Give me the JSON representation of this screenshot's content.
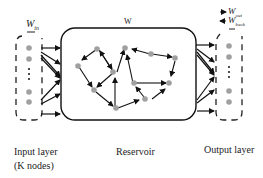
{
  "labels": {
    "w_in": "W",
    "w_in_sub": "in",
    "w": "W",
    "w_out": "W",
    "w_out_sub": "out",
    "w_back": "W",
    "w_back_sub": "back",
    "input_layer": "Input layer",
    "input_nodes": "(K nodes)",
    "reservoir": "Reservoir",
    "output_layer": "Output layer"
  },
  "colors": {
    "node": "#a0a0a0",
    "line": "#111111",
    "dash": "#222222"
  },
  "diagram": {
    "nodes": [
      "input-layer",
      "reservoir",
      "output-layer"
    ],
    "edges": [
      {
        "from": "input-layer",
        "to": "reservoir",
        "label": "W_in"
      },
      {
        "from": "reservoir",
        "to": "reservoir",
        "label": "W"
      },
      {
        "from": "reservoir",
        "to": "output-layer",
        "label": "W_out"
      },
      {
        "from": "output-layer",
        "to": "reservoir",
        "label": "W_back"
      }
    ]
  }
}
